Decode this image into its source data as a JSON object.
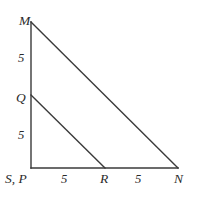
{
  "figure": {
    "background_color": "#ffffff",
    "stroke_color": "#3a3a3a",
    "label_color": "#2b2b2b",
    "stroke_width": 1.4,
    "vertices": {
      "M": {
        "label": "M",
        "x": 31,
        "y": 22
      },
      "Q": {
        "label": "Q",
        "x": 31,
        "y": 95
      },
      "SP": {
        "label": "S, P",
        "x": 31,
        "y": 168
      },
      "R": {
        "label": "R",
        "x": 105,
        "y": 168
      },
      "N": {
        "label": "N",
        "x": 178,
        "y": 168
      }
    },
    "segments": [
      {
        "name": "left-leg-MS",
        "from": "M",
        "to": "SP"
      },
      {
        "name": "base-SN",
        "from": "SP",
        "to": "N"
      },
      {
        "name": "hypotenuse-MN",
        "from": "M",
        "to": "N"
      },
      {
        "name": "parallel-QR",
        "from": "Q",
        "to": "R"
      }
    ],
    "measures": {
      "left_upper_MQ": "5",
      "left_lower_QS": "5",
      "base_left_SR": "5",
      "base_right_RN": "5"
    }
  },
  "chart_data": {
    "type": "diagram",
    "points": [
      {
        "name": "M",
        "x": 0,
        "y": 10
      },
      {
        "name": "Q",
        "x": 0,
        "y": 5
      },
      {
        "name": "S, P",
        "x": 0,
        "y": 0
      },
      {
        "name": "R",
        "x": 5,
        "y": 0
      },
      {
        "name": "N",
        "x": 10,
        "y": 0
      }
    ],
    "edges": [
      {
        "from": "M",
        "to": "S, P"
      },
      {
        "from": "S, P",
        "to": "N"
      },
      {
        "from": "M",
        "to": "N"
      },
      {
        "from": "Q",
        "to": "R"
      }
    ],
    "edge_labels": [
      {
        "edge": "M-Q",
        "value": "5"
      },
      {
        "edge": "Q-S, P",
        "value": "5"
      },
      {
        "edge": "S, P-R",
        "value": "5"
      },
      {
        "edge": "R-N",
        "value": "5"
      }
    ]
  }
}
